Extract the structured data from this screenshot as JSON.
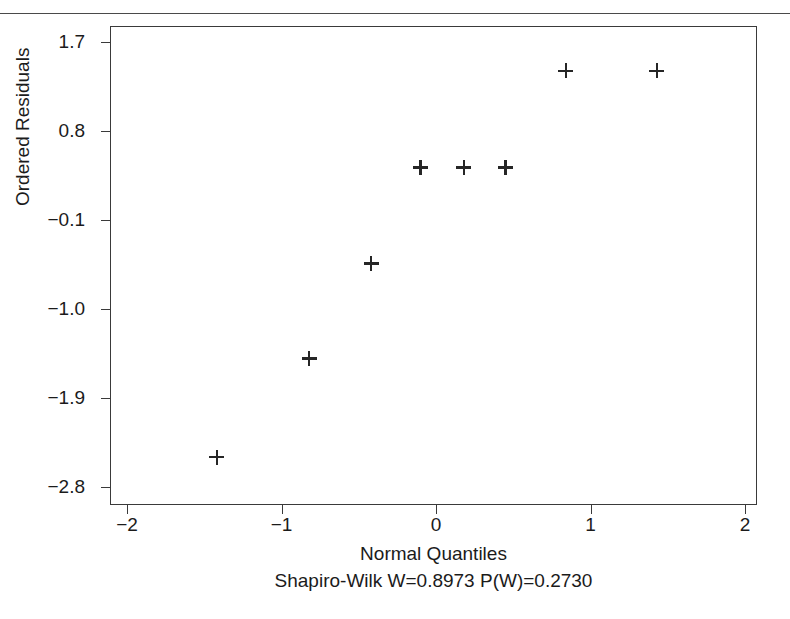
{
  "page": {
    "clipped_heading": "",
    "background_color": "#ffffff",
    "rule_color": "#4a4a4a"
  },
  "chart_data": {
    "type": "scatter",
    "title": "",
    "subtitle": "",
    "xlabel": "Normal Quantiles",
    "ylabel": "Ordered Residuals",
    "annotation": "Shapiro-Wilk W=0.8973  P(W)=0.2730",
    "statistics": {
      "shapiro_wilk_W": 0.8973,
      "p_value": 0.273,
      "W_label": "Shapiro-Wilk W=0.8973",
      "P_label": "P(W)=0.2730"
    },
    "xlim": [
      -2.18,
      2.08
    ],
    "ylim": [
      -3.07,
      1.88
    ],
    "xticks": [
      -2,
      -1,
      0,
      1,
      2
    ],
    "xticklabels": [
      "-2",
      "-1",
      "0",
      "1",
      "2"
    ],
    "yticks": [
      1.7,
      0.8,
      -0.1,
      -1.0,
      -1.9,
      -2.8
    ],
    "yticklabels": [
      "1.7",
      "0.8",
      "-0.1",
      "-1.0",
      "-1.9",
      "-2.8"
    ],
    "grid": false,
    "legend": null,
    "marker_symbol": "plus",
    "marker_color": "#262626",
    "points": [
      {
        "x": -1.42,
        "y": -2.5
      },
      {
        "x": -0.82,
        "y": -1.5
      },
      {
        "x": -0.42,
        "y": -0.54
      },
      {
        "x": -0.1,
        "y": 0.43
      },
      {
        "x": 0.18,
        "y": 0.43
      },
      {
        "x": 0.45,
        "y": 0.43
      },
      {
        "x": 0.84,
        "y": 1.41
      },
      {
        "x": 1.43,
        "y": 1.41
      }
    ],
    "n_points": 8
  }
}
